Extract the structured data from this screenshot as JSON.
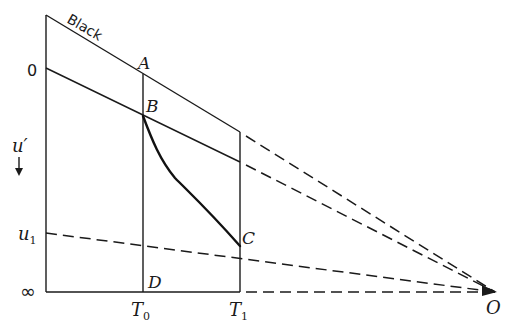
{
  "diagram": {
    "kind": "temperature-ionization diagram (lines converging at O)",
    "colors": {
      "ink": "#1a1a1a",
      "background": "#ffffff"
    },
    "labels": {
      "black": "Black",
      "zero": "0",
      "u_prime": "u′",
      "u1": "u",
      "u1_sub": "1",
      "infinity": "∞",
      "A": "A",
      "B": "B",
      "C": "C",
      "D": "D",
      "O": "O",
      "T0": "T",
      "T0_sub": "0",
      "T1": "T",
      "T1_sub": "1"
    },
    "axis": {
      "left_vertical": {
        "x": 46,
        "y_top": 15,
        "y_bottom": 292
      },
      "bottom_horizontal": {
        "y": 292,
        "x_start": 46,
        "x_end": 240
      },
      "arrow_direction": "down"
    },
    "points": {
      "top": [
        46,
        15
      ],
      "zero_level": [
        46,
        68
      ],
      "A": [
        143,
        74
      ],
      "B": [
        143,
        116
      ],
      "C": [
        240,
        246
      ],
      "D": [
        143,
        292
      ],
      "u1_level": [
        46,
        233
      ],
      "O": [
        495,
        292
      ]
    },
    "lines": [
      {
        "name": "black-line",
        "style": "solid",
        "from": [
          46,
          15
        ],
        "to": [
          240,
          132
        ]
      },
      {
        "name": "black-line-extension",
        "style": "dashed",
        "from": [
          240,
          132
        ],
        "to": [
          495,
          292
        ]
      },
      {
        "name": "zero-line",
        "style": "solid",
        "from": [
          46,
          68
        ],
        "to": [
          240,
          162
        ]
      },
      {
        "name": "zero-line-extension",
        "style": "dashed",
        "from": [
          240,
          162
        ],
        "to": [
          495,
          292
        ]
      },
      {
        "name": "u1-line",
        "style": "dashed",
        "from": [
          46,
          233
        ],
        "to": [
          495,
          292
        ]
      },
      {
        "name": "infinity-line-extension",
        "style": "dashed",
        "from": [
          240,
          292
        ],
        "to": [
          495,
          292
        ]
      },
      {
        "name": "T0-vertical",
        "style": "solid",
        "from": [
          143,
          74
        ],
        "to": [
          143,
          292
        ]
      },
      {
        "name": "T1-vertical",
        "style": "solid",
        "from": [
          240,
          132
        ],
        "to": [
          240,
          292
        ]
      },
      {
        "name": "curve-B-to-C",
        "style": "thick",
        "from": [
          143,
          116
        ],
        "to": [
          240,
          246
        ]
      }
    ]
  }
}
